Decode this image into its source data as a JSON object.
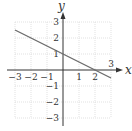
{
  "chart_data": {
    "type": "line",
    "title": "",
    "xlabel": "x",
    "ylabel": "y",
    "xlim": [
      -3,
      3
    ],
    "ylim": [
      -3,
      3
    ],
    "grid": true,
    "x_ticks": [
      "-3",
      "-2",
      "-1",
      "1",
      "2",
      "3"
    ],
    "y_ticks": [
      "3",
      "2",
      "1",
      "-1",
      "-2",
      "-3"
    ],
    "series": [
      {
        "name": "y = -x/2 + 1",
        "x": [
          -3,
          3
        ],
        "y": [
          2.5,
          -0.5
        ],
        "color": "#6b6b6b"
      }
    ],
    "annotations": {
      "x_intercept": [
        2,
        0
      ],
      "y_intercept": [
        0,
        1
      ]
    },
    "colors": {
      "axis": "#333333",
      "grid": "#d6d6d6",
      "line": "#6b6b6b"
    }
  },
  "labels": {
    "x_axis": "x",
    "y_axis": "y",
    "x_ticks": {
      "n3": "−3",
      "n2": "−2",
      "n1": "−1",
      "p1": "1",
      "p2": "2",
      "p3": "3"
    },
    "y_ticks": {
      "p3": "3",
      "p2": "2",
      "p1": "1",
      "n1": "−1",
      "n2": "−2",
      "n3": "−3"
    }
  }
}
